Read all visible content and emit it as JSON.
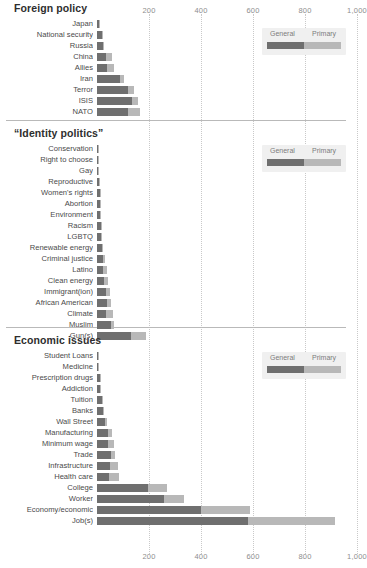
{
  "chart_data": {
    "type": "bar",
    "orientation": "horizontal",
    "stacked": true,
    "title": "",
    "xlabel": "",
    "ylabel": "",
    "xlim": [
      0,
      1000
    ],
    "xticks": [
      200,
      400,
      600,
      800,
      1000
    ],
    "xtick_labels": [
      "200",
      "400",
      "600",
      "800",
      "1,000"
    ],
    "grid": "vertical-dotted",
    "legend": {
      "position": "top-right-per-section",
      "entries": [
        {
          "name": "General",
          "color": "#6f6f6f"
        },
        {
          "name": "Primary",
          "color": "#b8b8b8"
        }
      ]
    },
    "series": [
      {
        "name": "General",
        "color": "#6f6f6f"
      },
      {
        "name": "Primary",
        "color": "#b8b8b8"
      }
    ],
    "sections": [
      {
        "title": "Foreign policy",
        "categories": [
          "Japan",
          "National security",
          "Russia",
          "China",
          "Allies",
          "Iran",
          "Terror",
          "ISIS",
          "NATO"
        ],
        "values": {
          "General": [
            7,
            18,
            22,
            36,
            40,
            88,
            120,
            133,
            118
          ],
          "Primary": [
            2,
            4,
            6,
            22,
            24,
            17,
            24,
            24,
            47
          ]
        }
      },
      {
        "title": "“Identity politics”",
        "categories": [
          "Conservation",
          "Right to choose",
          "Gay",
          "Reproductive",
          "Women's rights",
          "Abortion",
          "Environment",
          "Racism",
          "LGBTQ",
          "Renewable energy",
          "Criminal justice",
          "Latino",
          "Clean energy",
          "Immigrant(ion)",
          "African American",
          "Climate",
          "Muslim",
          "Gun(s)"
        ],
        "values": {
          "General": [
            2,
            4,
            5,
            8,
            11,
            12,
            13,
            14,
            16,
            19,
            22,
            23,
            27,
            33,
            39,
            35,
            55,
            130
          ],
          "Primary": [
            1,
            1,
            2,
            2,
            3,
            3,
            3,
            5,
            3,
            5,
            9,
            14,
            16,
            17,
            15,
            26,
            12,
            60
          ]
        }
      },
      {
        "title": "Economic issues",
        "categories": [
          "Student Loans",
          "Medicine",
          "Prescription drugs",
          "Addiction",
          "Tuition",
          "Banks",
          "Wall Street",
          "Manufacturing",
          "Minimum wage",
          "Trade",
          "Infrastructure",
          "Health care",
          "College",
          "Worker",
          "Economy/economic",
          "Job(s)"
        ],
        "values": {
          "General": [
            4,
            5,
            11,
            13,
            19,
            22,
            32,
            41,
            41,
            52,
            50,
            48,
            198,
            258,
            400,
            580
          ],
          "Primary": [
            1,
            1,
            3,
            3,
            5,
            6,
            8,
            17,
            23,
            18,
            30,
            35,
            72,
            78,
            190,
            335
          ]
        }
      }
    ]
  }
}
